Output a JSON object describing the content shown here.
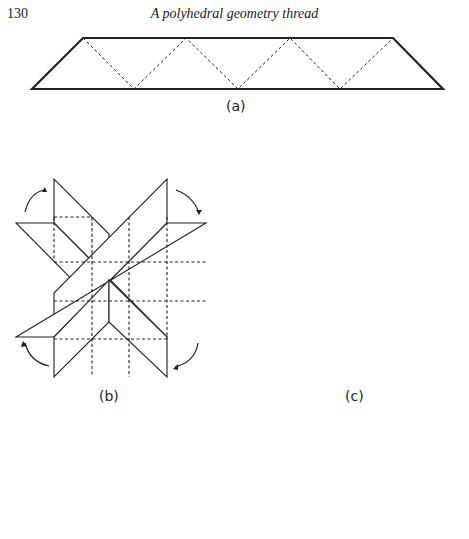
{
  "header": {
    "page_number": "130",
    "running_title": "A polyhedral geometry thread"
  },
  "figures": [
    {
      "id": "a",
      "label": "(a)",
      "description": "Trapezoidal strip with dashed zigzag fold lines"
    },
    {
      "id": "b",
      "label": "(b)",
      "description": "Two crossed strips forming an X with dashed fold squares and four curved rotation arrows"
    },
    {
      "id": "c",
      "label": "(c)",
      "description": "Folded unit with central shaded pyramid square, four triangular flaps with paper-clip slots, drop shadows"
    },
    {
      "id": "d",
      "label": "",
      "description": "Assembled polyhedron viewed from above (partially cropped)"
    }
  ]
}
